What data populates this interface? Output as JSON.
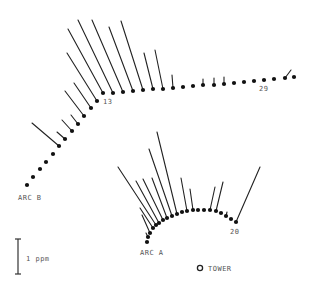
{
  "diagram": {
    "type": "vector-plume-map",
    "colors": {
      "ink": "#111111",
      "label": "#555555",
      "background": "#ffffff"
    },
    "scale_bar": {
      "label": "1 ppm",
      "value_ppm": 1
    },
    "tower": {
      "label": "TOWER",
      "icon": "open-circle-icon"
    },
    "arcs": [
      {
        "name": "ARC B",
        "marked_points": [
          {
            "index": 13,
            "label": "13"
          },
          {
            "index": 29,
            "label": "29"
          }
        ],
        "points": [
          {
            "x": 27,
            "y": 185,
            "ppm": 0
          },
          {
            "x": 33,
            "y": 177,
            "ppm": 0
          },
          {
            "x": 40,
            "y": 169,
            "ppm": 0
          },
          {
            "x": 46,
            "y": 162,
            "ppm": 0
          },
          {
            "x": 53,
            "y": 154,
            "ppm": 0
          },
          {
            "x": 59,
            "y": 146,
            "ppm": 1.0,
            "dx": -27,
            "dy": -23
          },
          {
            "x": 65,
            "y": 139,
            "ppm": 0.3,
            "dx": -8,
            "dy": -7
          },
          {
            "x": 72,
            "y": 131,
            "ppm": 0.45,
            "dx": -10,
            "dy": -11
          },
          {
            "x": 78,
            "y": 124,
            "ppm": 0.35,
            "dx": -7,
            "dy": -9
          },
          {
            "x": 84,
            "y": 116,
            "ppm": 0.85,
            "dx": -19,
            "dy": -25
          },
          {
            "x": 91,
            "y": 108,
            "ppm": 0.85,
            "dx": -17,
            "dy": -25
          },
          {
            "x": 97,
            "y": 101,
            "ppm": 1.55,
            "dx": -30,
            "dy": -48
          },
          {
            "x": 103,
            "y": 93,
            "ppm": 2.2,
            "dx": -35,
            "dy": -64
          },
          {
            "x": 113,
            "y": 93,
            "ppm": 2.4,
            "dx": -35,
            "dy": -73
          },
          {
            "x": 123,
            "y": 92,
            "ppm": 2.3,
            "dx": -31,
            "dy": -72
          },
          {
            "x": 133,
            "y": 91,
            "ppm": 1.95,
            "dx": -24,
            "dy": -64
          },
          {
            "x": 143,
            "y": 90,
            "ppm": 2.0,
            "dx": -22,
            "dy": -69
          },
          {
            "x": 153,
            "y": 89,
            "ppm": 1.05,
            "dx": -9,
            "dy": -36
          },
          {
            "x": 163,
            "y": 89,
            "ppm": 1.1,
            "dx": -8,
            "dy": -39
          },
          {
            "x": 173,
            "y": 88,
            "ppm": 0.4,
            "dx": -1,
            "dy": -13
          },
          {
            "x": 183,
            "y": 87,
            "ppm": 0
          },
          {
            "x": 193,
            "y": 86,
            "ppm": 0
          },
          {
            "x": 203,
            "y": 85,
            "ppm": 0.2,
            "dx": 0,
            "dy": -6
          },
          {
            "x": 214,
            "y": 85,
            "ppm": 0.2,
            "dx": 0,
            "dy": -7
          },
          {
            "x": 224,
            "y": 84,
            "ppm": 0.2,
            "dx": 0,
            "dy": -7
          },
          {
            "x": 234,
            "y": 83,
            "ppm": 0
          },
          {
            "x": 244,
            "y": 82,
            "ppm": 0
          },
          {
            "x": 254,
            "y": 81,
            "ppm": 0
          },
          {
            "x": 264,
            "y": 80,
            "ppm": 0
          },
          {
            "x": 274,
            "y": 79,
            "ppm": 0
          },
          {
            "x": 285,
            "y": 78,
            "ppm": 0.3,
            "dx": 6,
            "dy": -8
          },
          {
            "x": 294,
            "y": 77,
            "ppm": 0
          }
        ],
        "label_point_indices": [
          12,
          28
        ]
      },
      {
        "name": "ARC A",
        "marked_points": [
          {
            "index": 20,
            "label": "20"
          }
        ],
        "points": [
          {
            "x": 147,
            "y": 242,
            "ppm": 0
          },
          {
            "x": 148,
            "y": 237,
            "ppm": 0.15,
            "dx": -2,
            "dy": -4
          },
          {
            "x": 150,
            "y": 233,
            "ppm": 0.5,
            "dx": -8,
            "dy": -18
          },
          {
            "x": 153,
            "y": 228,
            "ppm": 0.55,
            "dx": -13,
            "dy": -20
          },
          {
            "x": 156,
            "y": 225,
            "ppm": 1.7,
            "dx": -38,
            "dy": -58
          },
          {
            "x": 159,
            "y": 223,
            "ppm": 1.3,
            "dx": -23,
            "dy": -42
          },
          {
            "x": 163,
            "y": 220,
            "ppm": 1.35,
            "dx": -20,
            "dy": -41
          },
          {
            "x": 167,
            "y": 218,
            "ppm": 1.3,
            "dx": -15,
            "dy": -40
          },
          {
            "x": 172,
            "y": 216,
            "ppm": 1.9,
            "dx": -23,
            "dy": -67
          },
          {
            "x": 177,
            "y": 214,
            "ppm": 2.3,
            "dx": -20,
            "dy": -82
          },
          {
            "x": 182,
            "y": 212,
            "ppm": 0
          },
          {
            "x": 187,
            "y": 211,
            "ppm": 1.0,
            "dx": -6,
            "dy": -33
          },
          {
            "x": 193,
            "y": 210,
            "ppm": 0.6,
            "dx": -3,
            "dy": -21
          },
          {
            "x": 198,
            "y": 210,
            "ppm": 0
          },
          {
            "x": 204,
            "y": 210,
            "ppm": 0
          },
          {
            "x": 210,
            "y": 210,
            "ppm": 0.65,
            "dx": 5,
            "dy": -23
          },
          {
            "x": 216,
            "y": 211,
            "ppm": 0.85,
            "dx": 7,
            "dy": -29
          },
          {
            "x": 221,
            "y": 213,
            "ppm": 0
          },
          {
            "x": 226,
            "y": 216,
            "ppm": 0.15,
            "dx": 1,
            "dy": -4
          },
          {
            "x": 231,
            "y": 219,
            "ppm": 0
          },
          {
            "x": 236,
            "y": 222,
            "ppm": 1.6,
            "dx": 24,
            "dy": -55
          }
        ],
        "label_point_indices": [
          20
        ]
      }
    ]
  }
}
